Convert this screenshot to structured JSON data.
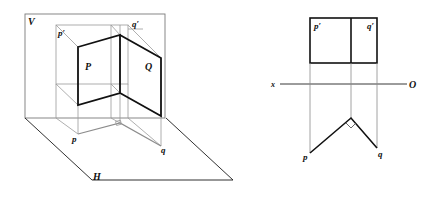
{
  "figure": {
    "left_view": {
      "description": "Axonometric view of two perpendicular planes P and Q projected onto V and H planes",
      "labels": {
        "V": "V",
        "H": "H",
        "P": "P",
        "Q": "Q",
        "p_prime": "p′",
        "q_prime": "q′",
        "p": "p",
        "q": "q"
      }
    },
    "right_view": {
      "description": "Orthographic projections: front view rectangles p′ q′ above x–O axis, top view V-shape p–q with right angle below",
      "labels": {
        "p_prime": "p′",
        "q_prime": "q′",
        "x": "x",
        "O": "O",
        "p": "p",
        "q": "q"
      },
      "right_angle_marker": true
    }
  }
}
